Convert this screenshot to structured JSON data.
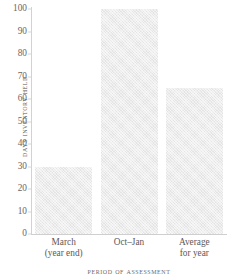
{
  "chart_data": {
    "type": "bar",
    "title": "",
    "xlabel": "Period of Assessment",
    "ylabel": "Days Inventory Held",
    "categories": [
      "March (year end)",
      "Oct–Jan",
      "Average for year"
    ],
    "values": [
      30,
      100,
      65
    ],
    "ylim": [
      0,
      100
    ],
    "yticks": [
      0,
      10,
      20,
      30,
      40,
      50,
      60,
      70,
      80,
      90,
      100
    ],
    "ytick_labels": [
      "0",
      "10",
      "20",
      "30",
      "40",
      "50",
      "60",
      "70",
      "80",
      "90",
      "100"
    ],
    "grid": false,
    "legend": false,
    "bar_color": "#e4e4e4",
    "axis_color": "#d2d2d2",
    "text_color": "#5d5858"
  },
  "axes": {
    "y_title": "Days Inventory Held",
    "x_title": "Period of Assessment"
  },
  "x_categories": [
    {
      "line1": "March",
      "line2": "(year end)"
    },
    {
      "line1": "Oct–Jan",
      "line2": ""
    },
    {
      "line1": "Average",
      "line2": "for year"
    }
  ],
  "y_ticks": [
    {
      "label": "100",
      "value": 100
    },
    {
      "label": "90",
      "value": 90
    },
    {
      "label": "80",
      "value": 80
    },
    {
      "label": "70",
      "value": 70
    },
    {
      "label": "60",
      "value": 60
    },
    {
      "label": "50",
      "value": 50
    },
    {
      "label": "40",
      "value": 40
    },
    {
      "label": "30",
      "value": 30
    },
    {
      "label": "20",
      "value": 20
    },
    {
      "label": "10",
      "value": 10
    },
    {
      "label": "0",
      "value": 0
    }
  ]
}
